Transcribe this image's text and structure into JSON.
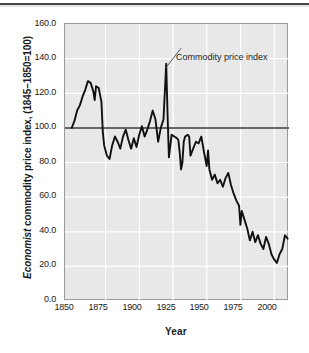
{
  "figure": {
    "background_color": "#ffffff",
    "plot_background_color": "#e8e8e8",
    "gridline_color": "#ffffff",
    "frame_color": "#9a9a9a",
    "line_color": "#111111",
    "reference_line_color": "#666666",
    "top_rule_color": "#4a4a4a"
  },
  "axis_titles": {
    "x": "Year",
    "y_italic_part": "Economist",
    "y_rest_part": " commodity price index, (1845–1850=100)"
  },
  "annotation": {
    "text": "Commodity price index",
    "points_to_year": 1920,
    "points_to_value": 135
  },
  "ticks": {
    "y": [
      "0.0",
      "20.0",
      "40.0",
      "60.0",
      "80.0",
      "100.0",
      "120.0",
      "140.0",
      "160.0"
    ],
    "x": [
      "1850",
      "1875",
      "1900",
      "1925",
      "1950",
      "1975",
      "2000"
    ]
  },
  "chart_data": {
    "type": "line",
    "title": "",
    "subtitle": "",
    "xlabel": "Year",
    "ylabel": "Economist commodity price index, (1845–1850=100)",
    "xlim": [
      1845,
      2011
    ],
    "ylim": [
      0,
      160
    ],
    "ytick_values": [
      0,
      20,
      40,
      60,
      80,
      100,
      120,
      140,
      160
    ],
    "xtick_values": [
      1850,
      1875,
      1900,
      1925,
      1950,
      1975,
      2000
    ],
    "grid": true,
    "legend": "none",
    "reference_line": {
      "y": 100,
      "label": "index base = 100"
    },
    "annotations": [
      {
        "text": "Commodity price index",
        "x": 1920,
        "y": 135,
        "label_x": 1931,
        "label_y": 146
      }
    ],
    "series": [
      {
        "name": "Commodity price index",
        "x": [
          1850,
          1852,
          1854,
          1856,
          1858,
          1860,
          1862,
          1864,
          1866,
          1867,
          1868,
          1870,
          1872,
          1873,
          1874,
          1876,
          1878,
          1880,
          1882,
          1884,
          1886,
          1888,
          1890,
          1892,
          1894,
          1896,
          1898,
          1900,
          1902,
          1904,
          1906,
          1908,
          1910,
          1912,
          1914,
          1916,
          1918,
          1920,
          1921,
          1922,
          1924,
          1926,
          1928,
          1929,
          1930,
          1931,
          1932,
          1933,
          1934,
          1936,
          1937,
          1938,
          1940,
          1942,
          1944,
          1946,
          1948,
          1950,
          1951,
          1952,
          1954,
          1956,
          1958,
          1960,
          1962,
          1964,
          1966,
          1968,
          1970,
          1972,
          1974,
          1975,
          1976,
          1978,
          1980,
          1982,
          1984,
          1986,
          1988,
          1990,
          1992,
          1994,
          1996,
          1998,
          2000,
          2002,
          2004,
          2006,
          2008,
          2010
        ],
        "y": [
          100,
          104,
          110,
          113,
          118,
          122,
          127,
          126,
          121,
          116,
          124,
          123,
          115,
          98,
          90,
          84,
          82,
          90,
          95,
          92,
          88,
          95,
          99,
          93,
          88,
          94,
          89,
          96,
          101,
          95,
          99,
          104,
          110,
          105,
          92,
          100,
          105,
          137,
          108,
          83,
          96,
          95,
          94,
          93,
          86,
          76,
          80,
          92,
          95,
          96,
          95,
          84,
          88,
          92,
          91,
          95,
          86,
          78,
          87,
          76,
          70,
          73,
          68,
          70,
          66,
          71,
          74,
          67,
          62,
          58,
          55,
          44,
          52,
          47,
          42,
          35,
          40,
          34,
          38,
          33,
          30,
          37,
          33,
          27,
          24,
          22,
          27,
          30,
          38,
          36
        ]
      }
    ]
  }
}
